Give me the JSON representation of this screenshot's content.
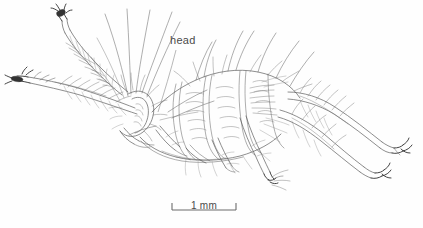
{
  "figure": {
    "type": "scientific-line-drawing",
    "background_color": "#fefefe",
    "ink_color": "#5a5a5a",
    "dark_ink_color": "#2b2b2b",
    "width": 423,
    "height": 228
  },
  "annotations": {
    "head": {
      "label": "head",
      "label_x": 170,
      "label_y": 34,
      "leader_from": [
        176,
        50
      ],
      "leader_to": [
        158,
        112
      ]
    }
  },
  "scale_bar": {
    "label": "1 mm",
    "x_start": 172,
    "x_end": 236,
    "y": 210,
    "tick_height": 7,
    "length_px": 64,
    "value": 1,
    "unit": "mm"
  }
}
